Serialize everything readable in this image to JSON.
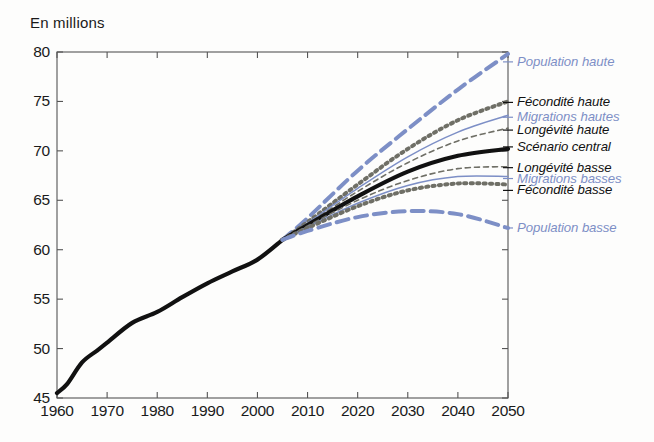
{
  "chart_data": {
    "type": "line",
    "title": "",
    "ylabel": "En millions",
    "xlabel": "",
    "xlim": [
      1960,
      2050
    ],
    "ylim": [
      45,
      80
    ],
    "xticks": [
      1960,
      1970,
      1980,
      1990,
      2000,
      2010,
      2020,
      2030,
      2040,
      2050
    ],
    "yticks": [
      45,
      50,
      55,
      60,
      65,
      70,
      75,
      80
    ],
    "grid": false,
    "legend_position": "right-inline",
    "x_projection_start": 2005,
    "series": [
      {
        "name": "Historique",
        "label": "",
        "color": "#111111",
        "style": "solid-thick",
        "x": [
          1960,
          1962,
          1965,
          1968,
          1970,
          1975,
          1980,
          1985,
          1990,
          1995,
          2000,
          2005
        ],
        "values": [
          45.5,
          46.4,
          48.6,
          49.8,
          50.6,
          52.6,
          53.7,
          55.2,
          56.6,
          57.8,
          59.0,
          61.0
        ]
      },
      {
        "name": "Population haute",
        "label": "Population haute",
        "color": "#7d8fc6",
        "style": "dashed-thick",
        "x": [
          2005,
          2010,
          2020,
          2030,
          2040,
          2050
        ],
        "values": [
          61.0,
          63.2,
          68.0,
          72.2,
          76.2,
          79.8
        ]
      },
      {
        "name": "Fécondité haute",
        "label": "Fécondité haute",
        "color": "#6f6f66",
        "style": "dotted-thick",
        "x": [
          2005,
          2010,
          2020,
          2030,
          2040,
          2050
        ],
        "values": [
          61.0,
          62.8,
          66.6,
          70.2,
          73.1,
          75.0
        ]
      },
      {
        "name": "Migrations hautes",
        "label": "Migrations hautes",
        "color": "#7d8fc6",
        "style": "solid-thin",
        "x": [
          2005,
          2010,
          2020,
          2030,
          2040,
          2050
        ],
        "values": [
          61.0,
          62.7,
          66.2,
          69.4,
          71.9,
          73.6
        ]
      },
      {
        "name": "Longévité haute",
        "label": "Longévité haute",
        "color": "#6f6f66",
        "style": "dashed-thin",
        "x": [
          2005,
          2010,
          2020,
          2030,
          2040,
          2050
        ],
        "values": [
          61.0,
          62.6,
          65.9,
          68.8,
          71.0,
          72.3
        ]
      },
      {
        "name": "Scénario central",
        "label": "Scénario central",
        "color": "#111111",
        "style": "solid-thick",
        "x": [
          2005,
          2010,
          2020,
          2030,
          2040,
          2050
        ],
        "values": [
          61.0,
          62.5,
          65.4,
          67.9,
          69.5,
          70.2
        ]
      },
      {
        "name": "Longévité basse",
        "label": "Longévité basse",
        "color": "#6f6f66",
        "style": "dashed-thin",
        "x": [
          2005,
          2010,
          2020,
          2030,
          2040,
          2050
        ],
        "values": [
          61.0,
          62.4,
          65.0,
          67.0,
          68.2,
          68.4
        ]
      },
      {
        "name": "Migrations basses",
        "label": "Migrations basses",
        "color": "#7d8fc6",
        "style": "solid-thin",
        "x": [
          2005,
          2010,
          2020,
          2030,
          2040,
          2050
        ],
        "values": [
          61.0,
          62.3,
          64.7,
          66.5,
          67.4,
          67.4
        ]
      },
      {
        "name": "Fécondité basse",
        "label": "Fécondité basse",
        "color": "#6f6f66",
        "style": "dotted-thick",
        "x": [
          2005,
          2010,
          2020,
          2030,
          2040,
          2050
        ],
        "values": [
          61.0,
          62.2,
          64.4,
          66.0,
          66.7,
          66.6
        ]
      },
      {
        "name": "Population basse",
        "label": "Population basse",
        "color": "#7d8fc6",
        "style": "dashed-thick",
        "x": [
          2005,
          2010,
          2020,
          2030,
          2040,
          2050
        ],
        "values": [
          61.0,
          61.9,
          63.3,
          63.9,
          63.6,
          62.2
        ]
      }
    ],
    "legend": [
      {
        "label": "Population haute",
        "color": "#7d8fc6",
        "y_value": 79.0
      },
      {
        "label": "Fécondité haute",
        "color": "#111111",
        "y_value": 74.9
      },
      {
        "label": "Migrations hautes",
        "color": "#7d8fc6",
        "y_value": 73.4
      },
      {
        "label": "Longévité haute",
        "color": "#111111",
        "y_value": 72.1
      },
      {
        "label": "Scénario central",
        "color": "#111111",
        "y_value": 70.4
      },
      {
        "label": "Longévité basse",
        "color": "#111111",
        "y_value": 68.3
      },
      {
        "label": "Migrations basses",
        "color": "#7d8fc6",
        "y_value": 67.2
      },
      {
        "label": "Fécondité basse",
        "color": "#111111",
        "y_value": 66.0
      },
      {
        "label": "Population basse",
        "color": "#7d8fc6",
        "y_value": 62.2
      }
    ]
  },
  "axis": {
    "ylabel": "En millions",
    "yticks": [
      "80",
      "75",
      "70",
      "65",
      "60",
      "55",
      "50",
      "45"
    ],
    "xticks": [
      "1960",
      "1970",
      "1980",
      "1990",
      "2000",
      "2010",
      "2020",
      "2030",
      "2040",
      "2050"
    ]
  },
  "colors": {
    "blue": "#7d8fc6",
    "black": "#111111",
    "gray": "#6f6f66",
    "axis": "#555555"
  }
}
